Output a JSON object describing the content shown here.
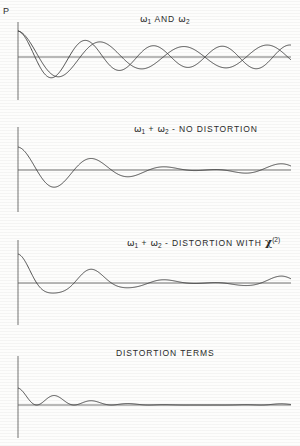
{
  "figure": {
    "y_axis_label": "P",
    "background_color": "#fdfdfc",
    "line_color": "#3a3a3a",
    "axis_color": "#5a5a5a"
  },
  "panels": [
    {
      "id": "omega1-and-omega2",
      "title_parts": [
        {
          "type": "sym",
          "text": "ω"
        },
        {
          "type": "sub",
          "text": "1"
        },
        {
          "type": "text",
          "text": " AND "
        },
        {
          "type": "sym",
          "text": "ω"
        },
        {
          "type": "sub",
          "text": "2"
        }
      ],
      "title_plain": "ω1 AND ω2",
      "title_x": 140,
      "title_y": 14,
      "axis": {
        "x": 18,
        "top": 22,
        "bottom": 100,
        "baseline": 57,
        "right": 291
      },
      "curves": [
        {
          "name": "omega1",
          "type": "cosine",
          "amplitude": 26,
          "period": 68,
          "phase": 0
        },
        {
          "name": "omega2",
          "type": "cosine",
          "amplitude": 26,
          "period": 83,
          "phase": 0
        }
      ]
    },
    {
      "id": "sum-no-distortion",
      "title_parts": [
        {
          "type": "sym",
          "text": "ω"
        },
        {
          "type": "sub",
          "text": "1"
        },
        {
          "type": "text",
          "text": " + "
        },
        {
          "type": "sym",
          "text": "ω"
        },
        {
          "type": "sub",
          "text": "2"
        },
        {
          "type": "text",
          "text": " - NO DISTORTION"
        }
      ],
      "title_plain": "ω1 + ω2 - No Distortion",
      "title_x": 134,
      "title_y": 124,
      "axis": {
        "x": 18,
        "top": 127,
        "bottom": 212,
        "baseline": 170,
        "right": 291
      },
      "curves": [
        {
          "name": "sum",
          "type": "sum",
          "amplitude": 23,
          "period_a": 68,
          "period_b": 83,
          "phase": 0
        }
      ]
    },
    {
      "id": "sum-distortion-chi2",
      "title_parts": [
        {
          "type": "sym",
          "text": "ω"
        },
        {
          "type": "sub",
          "text": "1"
        },
        {
          "type": "text",
          "text": " + "
        },
        {
          "type": "sym",
          "text": "ω"
        },
        {
          "type": "sub",
          "text": "2"
        },
        {
          "type": "text",
          "text": " - DISTORTION WITH "
        },
        {
          "type": "chi",
          "text": "χ"
        },
        {
          "type": "sup",
          "text": "(2)"
        }
      ],
      "title_plain": "ω1 + ω2 - Distortion with χ(2)",
      "title_x": 127,
      "title_y": 236,
      "axis": {
        "x": 18,
        "top": 240,
        "bottom": 325,
        "baseline": 283,
        "right": 291
      },
      "curves": [
        {
          "name": "sum-distorted",
          "type": "sum-distorted",
          "amplitude": 21,
          "period_a": 68,
          "period_b": 83,
          "phase": 0,
          "chi2_coefficient": 0.18
        }
      ]
    },
    {
      "id": "distortion-terms",
      "title_parts": [
        {
          "type": "text",
          "text": "DISTORTION TERMS"
        }
      ],
      "title_plain": "Distortion Terms",
      "title_x": 116,
      "title_y": 348,
      "axis": {
        "x": 18,
        "top": 356,
        "bottom": 438,
        "baseline": 405,
        "right": 291
      },
      "curves": [
        {
          "name": "distortion",
          "type": "distortion",
          "amplitude": 17,
          "period_a": 68,
          "period_b": 83,
          "phase": 0
        }
      ]
    }
  ]
}
